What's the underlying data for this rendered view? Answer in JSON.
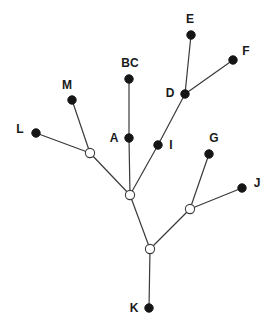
{
  "diagram": {
    "type": "tree",
    "nodes": [
      {
        "id": "BC",
        "label": "BC",
        "x": 129,
        "y": 79,
        "kind": "leaf",
        "lx": 130,
        "ly": 67
      },
      {
        "id": "M",
        "label": "M",
        "x": 72,
        "y": 100,
        "kind": "leaf",
        "lx": 67,
        "ly": 89
      },
      {
        "id": "L",
        "label": "L",
        "x": 36,
        "y": 133,
        "kind": "leaf",
        "lx": 20,
        "ly": 133
      },
      {
        "id": "A",
        "label": "A",
        "x": 129,
        "y": 138,
        "kind": "leaf",
        "lx": 114,
        "ly": 142
      },
      {
        "id": "I",
        "label": "I",
        "x": 158,
        "y": 145,
        "kind": "leaf",
        "lx": 171,
        "ly": 149
      },
      {
        "id": "D",
        "label": "D",
        "x": 185,
        "y": 94,
        "kind": "leaf",
        "lx": 170,
        "ly": 97
      },
      {
        "id": "E",
        "label": "E",
        "x": 191,
        "y": 35,
        "kind": "leaf",
        "lx": 190,
        "ly": 23
      },
      {
        "id": "F",
        "label": "F",
        "x": 233,
        "y": 60,
        "kind": "leaf",
        "lx": 246,
        "ly": 55
      },
      {
        "id": "G",
        "label": "G",
        "x": 209,
        "y": 154,
        "kind": "leaf",
        "lx": 214,
        "ly": 142
      },
      {
        "id": "J",
        "label": "J",
        "x": 242,
        "y": 188,
        "kind": "leaf",
        "lx": 257,
        "ly": 187
      },
      {
        "id": "K",
        "label": "K",
        "x": 149,
        "y": 308,
        "kind": "leaf",
        "lx": 134,
        "ly": 312
      },
      {
        "id": "n1",
        "label": "",
        "x": 90,
        "y": 153,
        "kind": "internal"
      },
      {
        "id": "n2",
        "label": "",
        "x": 130,
        "y": 195,
        "kind": "internal"
      },
      {
        "id": "n3",
        "label": "",
        "x": 190,
        "y": 209,
        "kind": "internal"
      },
      {
        "id": "n4",
        "label": "",
        "x": 150,
        "y": 249,
        "kind": "internal"
      }
    ],
    "edges": [
      [
        "BC",
        "A"
      ],
      [
        "A",
        "n2"
      ],
      [
        "M",
        "n1"
      ],
      [
        "L",
        "n1"
      ],
      [
        "n1",
        "n2"
      ],
      [
        "E",
        "D"
      ],
      [
        "F",
        "D"
      ],
      [
        "D",
        "I"
      ],
      [
        "I",
        "n2"
      ],
      [
        "n2",
        "n4"
      ],
      [
        "G",
        "n3"
      ],
      [
        "J",
        "n3"
      ],
      [
        "n3",
        "n4"
      ],
      [
        "n4",
        "K"
      ]
    ],
    "colors": {
      "edge": "#3a3a3a",
      "leaf_fill": "#151515",
      "internal_fill": "#ffffff",
      "label": "#1a1a1a"
    }
  }
}
